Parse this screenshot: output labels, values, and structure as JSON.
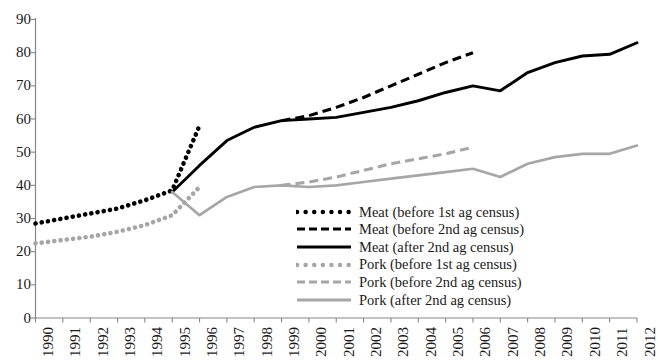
{
  "chart_data": {
    "type": "line",
    "title": "",
    "subtitle": "",
    "xlabel": "",
    "ylabel": "",
    "grid": false,
    "legend_position": "inside-center-bottom",
    "x": [
      1990,
      1991,
      1992,
      1993,
      1994,
      1995,
      1996,
      1997,
      1998,
      1999,
      2000,
      2001,
      2002,
      2003,
      2004,
      2005,
      2006,
      2007,
      2008,
      2009,
      2010,
      2011,
      2012
    ],
    "categories": [
      "1990",
      "1991",
      "1992",
      "1993",
      "1994",
      "1995",
      "1996",
      "1997",
      "1998",
      "1999",
      "2000",
      "2001",
      "2002",
      "2003",
      "2004",
      "2005",
      "2006",
      "2007",
      "2008",
      "2009",
      "2010",
      "2011",
      "2012"
    ],
    "xlim": [
      1990,
      2012
    ],
    "ylim": [
      0,
      90
    ],
    "yticks": [
      0,
      10,
      20,
      30,
      40,
      50,
      60,
      70,
      80,
      90
    ],
    "ytick_labels": [
      "0",
      "10",
      "20",
      "30",
      "40",
      "50",
      "60",
      "70",
      "80",
      "90"
    ],
    "series": [
      {
        "name": "Meat (before 1st ag census)",
        "style": "dotted",
        "color": "#000000",
        "x": [
          1990,
          1991,
          1992,
          1993,
          1994,
          1995,
          1996
        ],
        "values": [
          28.5,
          30.0,
          31.5,
          33.0,
          35.5,
          38.5,
          58.0
        ]
      },
      {
        "name": "Meat (before 2nd ag census)",
        "style": "dashed",
        "color": "#000000",
        "x": [
          1999,
          2000,
          2001,
          2002,
          2003,
          2004,
          2005,
          2006
        ],
        "values": [
          59.5,
          61.0,
          63.5,
          66.5,
          70.0,
          73.5,
          77.0,
          80.0
        ]
      },
      {
        "name": "Meat (after 2nd ag census)",
        "style": "solid",
        "color": "#000000",
        "x": [
          1995,
          1996,
          1997,
          1998,
          1999,
          2000,
          2001,
          2002,
          2003,
          2004,
          2005,
          2006,
          2007,
          2008,
          2009,
          2010,
          2011,
          2012
        ],
        "values": [
          38.0,
          46.0,
          53.5,
          57.5,
          59.5,
          60.0,
          60.5,
          62.0,
          63.5,
          65.5,
          68.0,
          70.0,
          68.5,
          74.0,
          77.0,
          79.0,
          79.5,
          83.0
        ]
      },
      {
        "name": "Pork (before 1st ag census)",
        "style": "dotted",
        "color": "#a6a6a6",
        "x": [
          1990,
          1991,
          1992,
          1993,
          1994,
          1995,
          1996
        ],
        "values": [
          22.5,
          23.5,
          24.5,
          26.0,
          28.0,
          31.0,
          39.5
        ]
      },
      {
        "name": "Pork (before 2nd ag census)",
        "style": "dashed",
        "color": "#a6a6a6",
        "x": [
          1999,
          2000,
          2001,
          2002,
          2003,
          2004,
          2005,
          2006
        ],
        "values": [
          40.0,
          41.0,
          42.5,
          44.5,
          46.5,
          48.0,
          49.5,
          51.5
        ]
      },
      {
        "name": "Pork (after 2nd ag census)",
        "style": "solid",
        "color": "#a6a6a6",
        "x": [
          1995,
          1996,
          1997,
          1998,
          1999,
          2000,
          2001,
          2002,
          2003,
          2004,
          2005,
          2006,
          2007,
          2008,
          2009,
          2010,
          2011,
          2012
        ],
        "values": [
          38.0,
          31.0,
          36.5,
          39.5,
          40.0,
          39.5,
          40.0,
          41.0,
          42.0,
          43.0,
          44.0,
          45.0,
          42.5,
          46.5,
          48.5,
          49.5,
          49.5,
          52.0
        ]
      }
    ],
    "colors": {
      "meat": "#000000",
      "pork": "#a6a6a6",
      "axis": "#868686",
      "text": "#1a1a1a"
    }
  },
  "legend": {
    "items": [
      {
        "label": "Meat (before 1st ag census)",
        "style": "dotted",
        "color": "#000000"
      },
      {
        "label": "Meat (before 2nd ag census)",
        "style": "dashed",
        "color": "#000000"
      },
      {
        "label": "Meat (after 2nd ag census)",
        "style": "solid",
        "color": "#000000"
      },
      {
        "label": "Pork (before 1st ag census)",
        "style": "dotted",
        "color": "#a6a6a6"
      },
      {
        "label": "Pork (before 2nd ag census)",
        "style": "dashed",
        "color": "#a6a6a6"
      },
      {
        "label": "Pork (after 2nd ag census)",
        "style": "solid",
        "color": "#a6a6a6"
      }
    ]
  }
}
